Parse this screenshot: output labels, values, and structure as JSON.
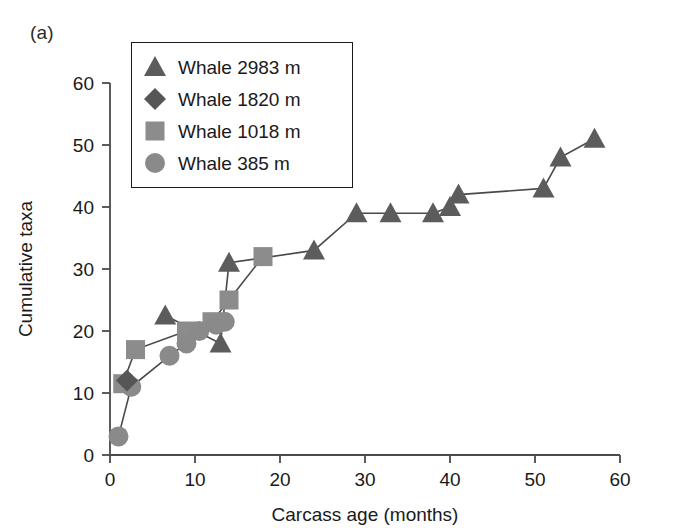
{
  "panel_label": "(a)",
  "legend": {
    "items": [
      {
        "label": "Whale 2983 m",
        "marker": "triangle-marker-icon",
        "color": "#5c5c5c"
      },
      {
        "label": "Whale 1820 m",
        "marker": "diamond-marker-icon",
        "color": "#565656"
      },
      {
        "label": "Whale 1018 m",
        "marker": "square-marker-icon",
        "color": "#8c8c8c"
      },
      {
        "label": "Whale 385 m",
        "marker": "circle-marker-icon",
        "color": "#8a8a8a"
      }
    ]
  },
  "chart_data": {
    "type": "line",
    "title": "",
    "xlabel": "Carcass age (months)",
    "ylabel": "Cumulative taxa",
    "xlim": [
      0,
      60
    ],
    "ylim": [
      0,
      60
    ],
    "xticks": [
      0,
      10,
      20,
      30,
      40,
      50,
      60
    ],
    "yticks": [
      0,
      10,
      20,
      30,
      40,
      50,
      60
    ],
    "grid": false,
    "legend_position": "top-left",
    "series": [
      {
        "name": "Whale 2983 m",
        "marker": "triangle",
        "color": "#5c5c5c",
        "points": [
          [
            6.5,
            22.5
          ],
          [
            13.0,
            18.0
          ],
          [
            14.0,
            31.0
          ],
          [
            24.0,
            33.0
          ],
          [
            29.0,
            39.0
          ],
          [
            33.0,
            39.0
          ],
          [
            38.0,
            39.0
          ],
          [
            40.0,
            40.0
          ],
          [
            41.0,
            42.0
          ],
          [
            51.0,
            43.0
          ],
          [
            53.0,
            48.0
          ],
          [
            57.0,
            51.0
          ]
        ]
      },
      {
        "name": "Whale 1820 m",
        "marker": "diamond",
        "color": "#565656",
        "points": [
          [
            2.0,
            12.0
          ]
        ]
      },
      {
        "name": "Whale 1018 m",
        "marker": "square",
        "color": "#8c8c8c",
        "points": [
          [
            1.5,
            11.5
          ],
          [
            3.0,
            17.0
          ],
          [
            9.0,
            20.0
          ],
          [
            12.0,
            21.5
          ],
          [
            14.0,
            25.0
          ],
          [
            18.0,
            32.0
          ]
        ]
      },
      {
        "name": "Whale 385 m",
        "marker": "circle",
        "color": "#8a8a8a",
        "points": [
          [
            1.0,
            3.0
          ],
          [
            2.5,
            11.0
          ],
          [
            7.0,
            16.0
          ],
          [
            9.0,
            18.0
          ],
          [
            10.5,
            20.0
          ],
          [
            12.5,
            21.0
          ],
          [
            13.5,
            21.5
          ]
        ]
      }
    ]
  }
}
